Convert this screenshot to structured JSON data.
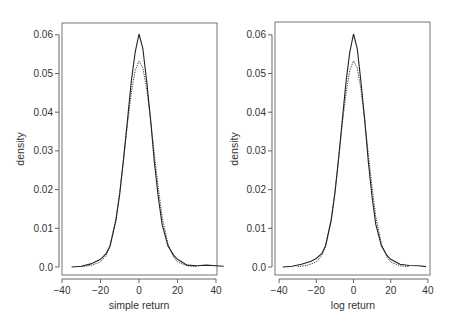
{
  "chart_data": [
    {
      "type": "line",
      "title": "",
      "xlabel": "simple return",
      "ylabel": "density",
      "xlim": [
        -40,
        40
      ],
      "ylim": [
        0,
        0.06
      ],
      "xticks": [
        "-40",
        "-20",
        "0",
        "20",
        "40"
      ],
      "yticks": [
        "0.0",
        "0.01",
        "0.02",
        "0.03",
        "0.04",
        "0.05",
        "0.06"
      ],
      "grid": false,
      "legend": null,
      "series": [
        {
          "name": "empirical density (solid)",
          "style": "solid",
          "x": [
            -35,
            -30,
            -25,
            -20,
            -17,
            -15,
            -12,
            -10,
            -8,
            -6,
            -4,
            -2,
            0,
            2,
            4,
            6,
            8,
            10,
            12,
            15,
            18,
            20,
            25,
            30,
            35,
            40,
            44
          ],
          "y": [
            0.0,
            0.0002,
            0.0008,
            0.002,
            0.0035,
            0.0055,
            0.012,
            0.019,
            0.028,
            0.038,
            0.048,
            0.0555,
            0.0602,
            0.0565,
            0.048,
            0.038,
            0.027,
            0.018,
            0.011,
            0.0055,
            0.003,
            0.002,
            0.0005,
            0.0003,
            0.0005,
            0.0003,
            0.0002
          ]
        },
        {
          "name": "normal density (dotted)",
          "style": "dotted",
          "x": [
            -30,
            -25,
            -20,
            -17,
            -15,
            -12,
            -10,
            -8,
            -6,
            -4,
            -2,
            0,
            2,
            4,
            6,
            8,
            10,
            12,
            15,
            18,
            20,
            25,
            30
          ],
          "y": [
            0.0001,
            0.0004,
            0.0013,
            0.003,
            0.0055,
            0.0125,
            0.0195,
            0.028,
            0.037,
            0.045,
            0.0508,
            0.0532,
            0.0515,
            0.046,
            0.038,
            0.029,
            0.0205,
            0.013,
            0.006,
            0.0025,
            0.0013,
            0.0003,
            0.0001
          ]
        }
      ]
    },
    {
      "type": "line",
      "title": "",
      "xlabel": "log return",
      "ylabel": "density",
      "xlim": [
        -40,
        40
      ],
      "ylim": [
        0,
        0.06
      ],
      "xticks": [
        "-40",
        "-20",
        "0",
        "20",
        "40"
      ],
      "yticks": [
        "0.0",
        "0.01",
        "0.02",
        "0.03",
        "0.04",
        "0.05",
        "0.06"
      ],
      "grid": false,
      "legend": null,
      "series": [
        {
          "name": "empirical density (solid)",
          "style": "solid",
          "x": [
            -38,
            -33,
            -28,
            -23,
            -20,
            -17,
            -15,
            -12,
            -10,
            -8,
            -6,
            -4,
            -2,
            0,
            2,
            4,
            6,
            8,
            10,
            12,
            15,
            18,
            20,
            25,
            30,
            35,
            39
          ],
          "y": [
            0.0,
            0.0002,
            0.0007,
            0.0014,
            0.0022,
            0.0035,
            0.0055,
            0.012,
            0.019,
            0.028,
            0.038,
            0.048,
            0.0555,
            0.0602,
            0.0565,
            0.048,
            0.038,
            0.027,
            0.018,
            0.011,
            0.0055,
            0.003,
            0.002,
            0.0007,
            0.0004,
            0.0003,
            0.0001
          ]
        },
        {
          "name": "normal density (dotted)",
          "style": "dotted",
          "x": [
            -30,
            -25,
            -20,
            -17,
            -15,
            -12,
            -10,
            -8,
            -6,
            -4,
            -2,
            0,
            2,
            4,
            6,
            8,
            10,
            12,
            15,
            18,
            20,
            25,
            30
          ],
          "y": [
            0.0001,
            0.0004,
            0.0013,
            0.003,
            0.0055,
            0.0125,
            0.0195,
            0.028,
            0.037,
            0.045,
            0.0508,
            0.0532,
            0.0515,
            0.046,
            0.038,
            0.029,
            0.0205,
            0.013,
            0.006,
            0.0025,
            0.0013,
            0.0003,
            0.0001
          ]
        }
      ]
    }
  ],
  "panels": [
    {
      "xlabel": "simple return",
      "ylabel": "density"
    },
    {
      "xlabel": "log return",
      "ylabel": "density"
    }
  ]
}
